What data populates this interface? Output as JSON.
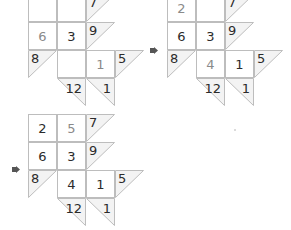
{
  "colors": {
    "grid_line": "#bdbdbd",
    "clue_fill": "#f3f3f3",
    "given_digit": "#2b2b2b",
    "solved_digit": "#8a8a8a",
    "arrow": "#555555"
  },
  "panels": [
    {
      "id": "step-1",
      "cells": {
        "r1c1": "",
        "r1c2": "",
        "r1c3_clue": "7",
        "r2c1": "6",
        "r2c2": "3",
        "r2c3_clue": "9",
        "r3c0_clue": "8",
        "r3c1": "",
        "r3c2": "1",
        "r3c3_clue": "5",
        "r4c1_clue": "12",
        "r4c2_clue": "1"
      }
    },
    {
      "id": "step-2",
      "cells": {
        "r1c1": "2",
        "r1c2": "",
        "r1c3_clue": "7",
        "r2c1": "6",
        "r2c2": "3",
        "r2c3_clue": "9",
        "r3c0_clue": "8",
        "r3c1": "4",
        "r3c2": "1",
        "r3c3_clue": "5",
        "r4c1_clue": "12",
        "r4c2_clue": "1"
      }
    },
    {
      "id": "step-3",
      "cells": {
        "r1c1": "2",
        "r1c2": "5",
        "r1c3_clue": "7",
        "r2c1": "6",
        "r2c2": "3",
        "r2c3_clue": "9",
        "r3c0_clue": "8",
        "r3c1": "4",
        "r3c2": "1",
        "r3c3_clue": "5",
        "r4c1_clue": "12",
        "r4c2_clue": "1"
      }
    }
  ],
  "arrows": [
    {
      "icon": "arrow-right-icon"
    },
    {
      "icon": "arrow-right-icon"
    }
  ]
}
